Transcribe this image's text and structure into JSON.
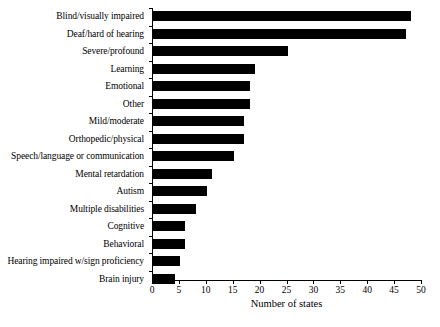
{
  "chart_data": {
    "type": "bar",
    "orientation": "horizontal",
    "title": "",
    "subtitle": "",
    "xlabel": "Number of states",
    "ylabel": "",
    "xlim": [
      0,
      50
    ],
    "xticks": [
      0,
      5,
      10,
      15,
      20,
      25,
      30,
      35,
      40,
      45,
      50
    ],
    "grid": false,
    "legend": null,
    "bar_color": "#000000",
    "axis_color": "#000000",
    "background": "#ffffff",
    "categories": [
      "Blind/visually impaired",
      "Deaf/hard of hearing",
      "Severe/profound",
      "Learning",
      "Emotional",
      "Other",
      "Mild/moderate",
      "Orthopedic/physical",
      "Speech/language or communication",
      "Mental retardation",
      "Autism",
      "Multiple disabilities",
      "Cognitive",
      "Behavioral",
      "Hearing impaired w/sign proficiency",
      "Brain injury"
    ],
    "values": [
      48,
      47,
      25,
      19,
      18,
      18,
      17,
      17,
      15,
      11,
      10,
      8,
      6,
      6,
      5,
      4
    ]
  }
}
